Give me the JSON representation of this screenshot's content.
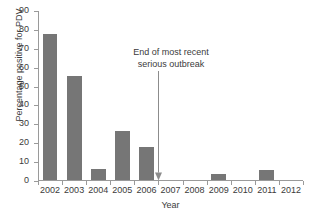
{
  "chart_data": {
    "type": "bar",
    "title": "",
    "xlabel": "Year",
    "ylabel": "Percentage positive for PDV",
    "categories": [
      "2002",
      "2003",
      "2004",
      "2005",
      "2006",
      "2007",
      "2008",
      "2009",
      "2010",
      "2011",
      "2012"
    ],
    "values": [
      77.5,
      55,
      6,
      26,
      17.5,
      0,
      0,
      3,
      0,
      5.5,
      0
    ],
    "ylim": [
      0,
      90
    ],
    "yticks": [
      0,
      10,
      20,
      30,
      40,
      50,
      60,
      70,
      80,
      90
    ],
    "ytick_labels": [
      "0",
      "10",
      "20",
      "30",
      "40",
      "50",
      "60",
      "70",
      "80",
      "90"
    ],
    "grid": false,
    "legend": null,
    "bar_color": "#767676",
    "axis_color": "#9a9a9a",
    "text_color": "#3b3b3b",
    "annotations": [
      {
        "text_line_1": "End of most recent",
        "text_line_2": "serious outbreak",
        "arrow": "down-arrow",
        "arrow_x_value": 2006.5,
        "arrow_from_y": 58,
        "arrow_to_y": 0
      }
    ]
  }
}
